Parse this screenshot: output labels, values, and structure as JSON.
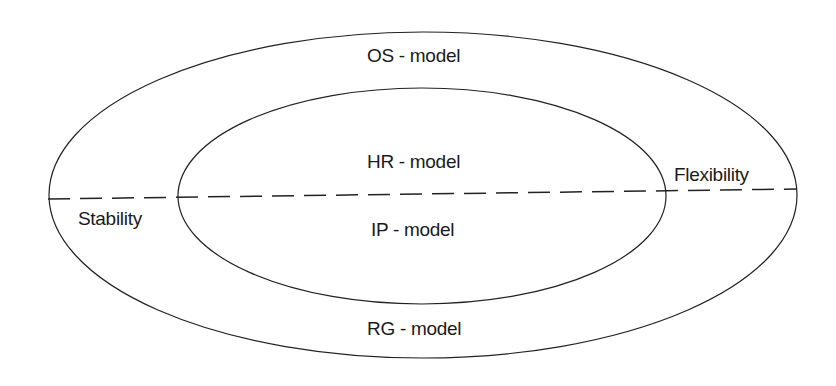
{
  "diagram": {
    "outer_ring_top_label": "OS - model",
    "outer_ring_bottom_label": "RG - model",
    "inner_top_label": "HR - model",
    "inner_bottom_label": "IP - model",
    "left_axis_label": "Stability",
    "right_axis_label": "Flexibility",
    "stroke_color": "#222222",
    "background_color": "#ffffff"
  }
}
